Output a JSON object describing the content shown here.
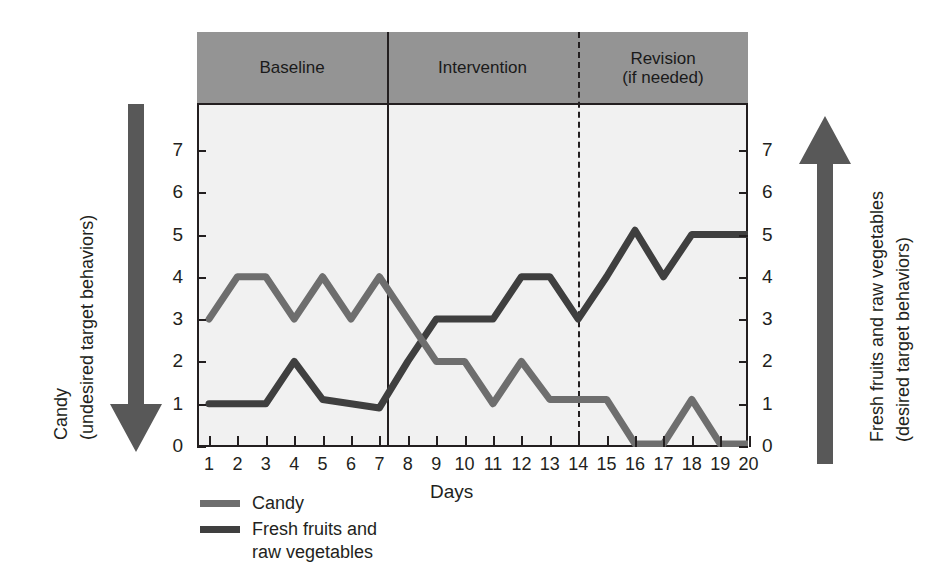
{
  "chart_data": {
    "type": "line",
    "title": "",
    "xlabel": "Days",
    "ylabel": "",
    "x": [
      1,
      2,
      3,
      4,
      5,
      6,
      7,
      8,
      9,
      10,
      11,
      12,
      13,
      14,
      15,
      16,
      17,
      18,
      19,
      20
    ],
    "xtick_labels": [
      "1",
      "2",
      "3",
      "4",
      "5",
      "6",
      "7",
      "8",
      "9",
      "10",
      "11",
      "12",
      "13",
      "14",
      "15",
      "16",
      "17",
      "18",
      "19",
      "20"
    ],
    "ytick_labels": [
      "7",
      "6",
      "5",
      "4",
      "3",
      "2",
      "1",
      "0"
    ],
    "ylim": [
      0,
      7.8
    ],
    "grid": false,
    "legend_position": "below-left",
    "series": [
      {
        "name": "Candy",
        "color": "#6e6e6e",
        "values": [
          3,
          4,
          4,
          3,
          4,
          3,
          4,
          3,
          2,
          2,
          1,
          2,
          1.1,
          1.1,
          1.1,
          0.05,
          0.05,
          1.1,
          0.05,
          0.05
        ]
      },
      {
        "name": "Fresh fruits and raw vegetables",
        "color": "#3f3f3f",
        "values": [
          1,
          1,
          1,
          2,
          1.1,
          1,
          0.9,
          2,
          3,
          3,
          3,
          4,
          4,
          3,
          4,
          5.1,
          4,
          5,
          5,
          5
        ]
      }
    ],
    "phases": [
      {
        "label": "Baseline",
        "start_day": 1,
        "end_day": 7.5,
        "divider": "solid"
      },
      {
        "label": "Intervention",
        "start_day": 7.5,
        "end_day": 14.5,
        "divider": "dashed"
      },
      {
        "label": "Revision\n(if needed)",
        "start_day": 14.5,
        "end_day": 20.5,
        "divider": "none"
      }
    ]
  },
  "axes": {
    "left": {
      "title": "Candy",
      "subtitle": "(undesired target behaviors)",
      "arrow": "down-arrow"
    },
    "right": {
      "title": "Fresh fruits and raw vegetables",
      "subtitle": "(desired target behaviors)",
      "arrow": "up-arrow"
    },
    "x_axis_title": "Days"
  },
  "legend": {
    "items": [
      {
        "label": "Candy",
        "color": "#6e6e6e"
      },
      {
        "label": "Fresh fruits and\nraw vegetables",
        "color": "#3f3f3f"
      }
    ]
  },
  "colors": {
    "band": "#949494",
    "plot_background": "#f1f1f1",
    "axis": "#231f20",
    "arrow": "#585858",
    "candy_line": "#6e6e6e",
    "fruit_line": "#3f3f3f"
  }
}
